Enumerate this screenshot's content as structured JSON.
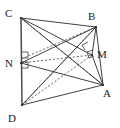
{
  "figure": {
    "width": 120,
    "height": 128,
    "background": "#ffffff",
    "stroke_solid": "#2b2b2b",
    "stroke_dashed": "#4a4a4a",
    "label_color": "#1a1a1a"
  },
  "vertices": [
    {
      "id": "C",
      "label": "C",
      "x": 21,
      "y": 18,
      "label_x": 7,
      "label_y": 14
    },
    {
      "id": "B",
      "label": "B",
      "x": 96,
      "y": 27,
      "label_x": 90,
      "label_y": 20
    },
    {
      "id": "M",
      "label": "M",
      "x": 92,
      "y": 55,
      "label_x": 98,
      "label_y": 57
    },
    {
      "id": "A",
      "label": "A",
      "x": 103,
      "y": 85,
      "label_x": 104,
      "label_y": 97
    },
    {
      "id": "N",
      "label": "N",
      "x": 21,
      "y": 63,
      "label_x": 6,
      "label_y": 67
    },
    {
      "id": "D",
      "label": "D",
      "x": 22,
      "y": 105,
      "label_x": 9,
      "label_y": 122
    }
  ],
  "edges_solid": [
    {
      "name": "edge-C-B",
      "from": "C",
      "to": "B"
    },
    {
      "name": "edge-B-A",
      "from": "B",
      "to": "A"
    },
    {
      "name": "edge-A-D",
      "from": "A",
      "to": "D"
    },
    {
      "name": "edge-C-D",
      "from": "C",
      "to": "D"
    },
    {
      "name": "edge-C-A",
      "from": "C",
      "to": "A"
    },
    {
      "name": "edge-C-M",
      "from": "C",
      "to": "M"
    },
    {
      "name": "edge-N-B",
      "from": "N",
      "to": "B"
    },
    {
      "name": "edge-N-A",
      "from": "N",
      "to": "A"
    },
    {
      "name": "edge-D-B",
      "from": "D",
      "to": "B"
    },
    {
      "name": "edge-M-A",
      "from": "M",
      "to": "A"
    }
  ],
  "edges_dashed": [
    {
      "name": "edge-dashed-N-M",
      "from": "N",
      "to": "M"
    },
    {
      "name": "edge-dashed-D-M",
      "from": "D",
      "to": "M"
    },
    {
      "name": "edge-dashed-D-C",
      "from": "D",
      "to": "B"
    },
    {
      "name": "edge-dashed-C-A-alt",
      "from": "C",
      "to": "A"
    },
    {
      "name": "edge-dashed-N-A-alt",
      "from": "N",
      "to": "A"
    }
  ],
  "right_angle_marks": [
    {
      "name": "right-angle-N-upper",
      "x": 21,
      "y": 54,
      "size": 6,
      "dir": "up-right"
    },
    {
      "name": "right-angle-N-lower",
      "x": 21,
      "y": 63,
      "size": 6,
      "dir": "down-right"
    },
    {
      "name": "right-angle-M",
      "x": 92,
      "y": 55,
      "size": 6,
      "dir": "up-left"
    },
    {
      "name": "right-angle-B-lower",
      "x": 87,
      "y": 46,
      "size": 6,
      "dir": "up-left"
    }
  ],
  "labels": {
    "C": "C",
    "B": "B",
    "M": "M",
    "A": "A",
    "N": "N",
    "D": "D"
  }
}
